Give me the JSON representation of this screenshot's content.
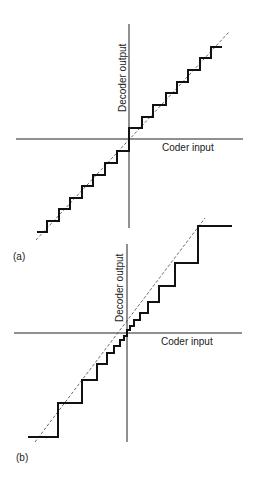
{
  "figure": {
    "panels": [
      {
        "id": "a",
        "panel_label": "(a)",
        "x_axis_label": "Coder input",
        "y_axis_label": "Decoder output",
        "quantizer": "uniform",
        "axes": {
          "origin": [
            129,
            139
          ],
          "h": [
            16,
            243
          ],
          "v": [
            24,
            228
          ]
        },
        "diagonal": [
          [
            36,
            240
          ],
          [
            229,
            32
          ]
        ],
        "staircase": [
          [
            37,
            232
          ],
          [
            47,
            232
          ],
          [
            47,
            221
          ],
          [
            59,
            221
          ],
          [
            59,
            209
          ],
          [
            70,
            209
          ],
          [
            70,
            198
          ],
          [
            82,
            198
          ],
          [
            82,
            186
          ],
          [
            93,
            186
          ],
          [
            93,
            175
          ],
          [
            105,
            175
          ],
          [
            105,
            163
          ],
          [
            117,
            163
          ],
          [
            117,
            151
          ],
          [
            129,
            151
          ],
          [
            129,
            128
          ],
          [
            142,
            128
          ],
          [
            142,
            117
          ],
          [
            153,
            117
          ],
          [
            153,
            105
          ],
          [
            166,
            105
          ],
          [
            166,
            93
          ],
          [
            177,
            93
          ],
          [
            177,
            82
          ],
          [
            188,
            82
          ],
          [
            188,
            70
          ],
          [
            200,
            70
          ],
          [
            200,
            58
          ],
          [
            211,
            58
          ],
          [
            211,
            47
          ],
          [
            222,
            47
          ]
        ]
      },
      {
        "id": "b",
        "panel_label": "(b)",
        "x_axis_label": "Coder input",
        "y_axis_label": "Decoder output",
        "quantizer": "non-uniform (companded)",
        "axes": {
          "origin": [
            127,
            333
          ],
          "h": [
            14,
            242
          ],
          "v": [
            244,
            442
          ]
        },
        "diagonal": [
          [
            35,
            442
          ],
          [
            205,
            218
          ]
        ],
        "staircase": [
          [
            28,
            437
          ],
          [
            58,
            437
          ],
          [
            58,
            403
          ],
          [
            82,
            403
          ],
          [
            82,
            380
          ],
          [
            97,
            380
          ],
          [
            97,
            364
          ],
          [
            107,
            364
          ],
          [
            107,
            353
          ],
          [
            114,
            353
          ],
          [
            114,
            346
          ],
          [
            120,
            346
          ],
          [
            120,
            340
          ],
          [
            124,
            340
          ],
          [
            124,
            336
          ],
          [
            127,
            336
          ],
          [
            127,
            330
          ],
          [
            130,
            330
          ],
          [
            130,
            326
          ],
          [
            134,
            326
          ],
          [
            134,
            320
          ],
          [
            140,
            320
          ],
          [
            140,
            313
          ],
          [
            148,
            313
          ],
          [
            148,
            302
          ],
          [
            159,
            302
          ],
          [
            159,
            286
          ],
          [
            175,
            286
          ],
          [
            175,
            263
          ],
          [
            198,
            263
          ],
          [
            198,
            226
          ],
          [
            232,
            226
          ]
        ]
      }
    ]
  }
}
